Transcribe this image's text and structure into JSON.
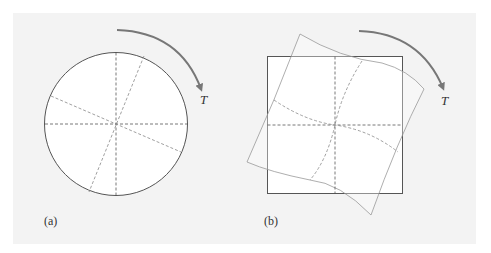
{
  "figure": {
    "panels": [
      {
        "label": "(a)",
        "shape": "circle",
        "description": "Circular cross-section with reference lines; twisted lines rotated under torque",
        "torque_label": "T"
      },
      {
        "label": "(b)",
        "shape": "square",
        "description": "Square cross-section with reference lines; warped outline and curved lines under torque",
        "torque_label": "T"
      }
    ],
    "colors": {
      "background": "#f3f3f3",
      "shape_fill": "#ffffff",
      "outline": "#555555",
      "dashed": "#666666",
      "deformed": "#999999",
      "arrow": "#777777"
    }
  }
}
